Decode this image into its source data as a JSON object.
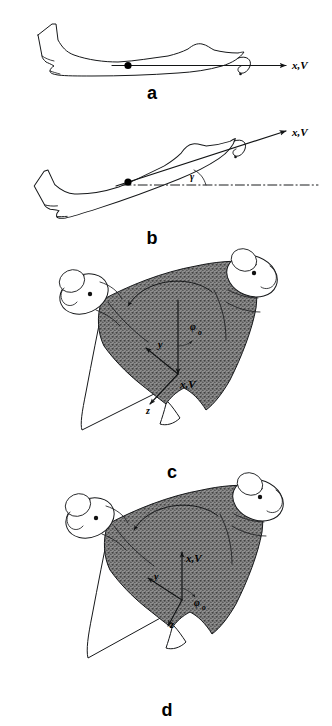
{
  "figure": {
    "background_color": "#ffffff",
    "ink_color": "#16181a",
    "shading_color": "#6e6e6e",
    "width": 332,
    "height": 726
  },
  "panels": [
    {
      "id": "a",
      "letter": "a",
      "view": "side-view-level-flight",
      "description": "Side view of jet aircraft in straight and level flight",
      "labels": [
        {
          "name": "velocity-axis-label",
          "text": "x,V",
          "x": 292,
          "y": 66
        }
      ],
      "annotations": {
        "has_cg_dot": true,
        "has_roll_curl_arrow": true,
        "has_reference_line": false,
        "flight_path_angle": null
      }
    },
    {
      "id": "b",
      "letter": "b",
      "view": "side-view-climbing-flight",
      "description": "Side view of jet aircraft climbing at flight path angle gamma",
      "labels": [
        {
          "name": "velocity-axis-label",
          "text": "x,V",
          "x": 293,
          "y": 134
        },
        {
          "name": "flight-path-angle-label",
          "text": "γ",
          "x": 193,
          "y": 172
        }
      ],
      "annotations": {
        "has_cg_dot": true,
        "has_roll_curl_arrow": true,
        "has_reference_line": true,
        "flight_path_angle": "γ"
      }
    },
    {
      "id": "c",
      "letter": "c",
      "view": "rear-view-banked-nose-down",
      "description": "Rear view of delta-wing aircraft with wingtip nacelles, banked, x axis pointing down",
      "labels": [
        {
          "name": "y-axis-label",
          "text": "y",
          "x": 162,
          "y": 344
        },
        {
          "name": "x-velocity-axis-label",
          "text": "x,V",
          "x": 188,
          "y": 382
        },
        {
          "name": "z-axis-label",
          "text": "z",
          "x": 152,
          "y": 408
        },
        {
          "name": "bank-angle-label",
          "text": "φ",
          "x": 196,
          "y": 327
        },
        {
          "name": "bank-angle-subscript",
          "text": "o",
          "x": 203,
          "y": 332
        }
      ],
      "annotations": {
        "axis_x_direction": "down",
        "axis_y_direction": "down-left",
        "axis_z_direction": "down-left-steep",
        "bank_angle": "φo",
        "has_arc_arrow": true
      }
    },
    {
      "id": "d",
      "letter": "d",
      "view": "rear-view-banked-nose-up",
      "description": "Rear view of delta-wing aircraft with wingtip nacelles, banked, x axis pointing up",
      "labels": [
        {
          "name": "y-axis-label",
          "text": "y",
          "x": 158,
          "y": 577
        },
        {
          "name": "x-velocity-axis-label",
          "text": "x,V",
          "x": 192,
          "y": 565
        },
        {
          "name": "z-axis-label",
          "text": "z",
          "x": 175,
          "y": 618
        },
        {
          "name": "bank-angle-label",
          "text": "φ",
          "x": 198,
          "y": 597
        },
        {
          "name": "bank-angle-subscript",
          "text": "o",
          "x": 205,
          "y": 601
        }
      ],
      "annotations": {
        "axis_x_direction": "up",
        "axis_y_direction": "left",
        "axis_z_direction": "down-left",
        "bank_angle": "φo",
        "has_arc_arrow": true
      }
    }
  ],
  "panel_letters": {
    "a": {
      "text": "a",
      "x": 152,
      "y": 99
    },
    "b": {
      "text": "b",
      "x": 152,
      "y": 244
    },
    "c": {
      "text": "c",
      "x": 172,
      "y": 478
    },
    "d": {
      "text": "d",
      "x": 167,
      "y": 716
    }
  },
  "symbols": {
    "velocity_axis": "x,V",
    "lateral_axis": "y",
    "vertical_axis": "z",
    "flight_path_angle": "γ",
    "bank_angle": "φo"
  }
}
